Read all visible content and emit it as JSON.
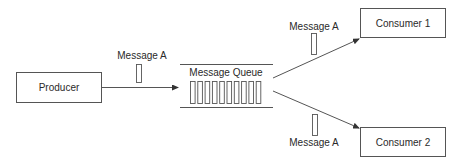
{
  "diagram": {
    "title": "",
    "nodes": {
      "producer": {
        "label": "Producer"
      },
      "queue": {
        "label": "Message Queue",
        "slot_count": 10
      },
      "consumer1": {
        "label": "Consumer 1"
      },
      "consumer2": {
        "label": "Consumer 2"
      }
    },
    "messages": {
      "to_queue": {
        "label": "Message A"
      },
      "to_consumer1": {
        "label": "Message A"
      },
      "to_consumer2": {
        "label": "Message A"
      }
    },
    "edges": [
      {
        "from": "producer",
        "to": "queue",
        "label": "Message A"
      },
      {
        "from": "queue",
        "to": "consumer1",
        "label": "Message A"
      },
      {
        "from": "queue",
        "to": "consumer2",
        "label": "Message A"
      }
    ],
    "colors": {
      "stroke": "#555555",
      "text": "#2a2a2a",
      "background": "#ffffff"
    }
  }
}
